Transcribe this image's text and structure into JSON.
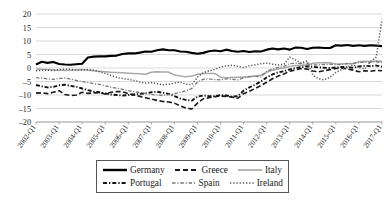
{
  "chart_data": {
    "type": "line",
    "title": "",
    "xlabel": "",
    "ylabel": "",
    "ylim": [
      -20,
      20
    ],
    "ytick_step": 5,
    "yticks": [
      "20",
      "15",
      "10",
      "5",
      "0",
      "-5",
      "-10",
      "-15",
      "-20"
    ],
    "grid": true,
    "legend_position": "bottom",
    "categories": [
      "2002-Q1",
      "2002-Q2",
      "2002-Q3",
      "2002-Q4",
      "2003-Q1",
      "2003-Q2",
      "2003-Q3",
      "2003-Q4",
      "2004-Q1",
      "2004-Q2",
      "2004-Q3",
      "2004-Q4",
      "2005-Q1",
      "2005-Q2",
      "2005-Q3",
      "2005-Q4",
      "2006-Q1",
      "2006-Q2",
      "2006-Q3",
      "2006-Q4",
      "2007-Q1",
      "2007-Q2",
      "2007-Q3",
      "2007-Q4",
      "2008-Q1",
      "2008-Q2",
      "2008-Q3",
      "2008-Q4",
      "2009-Q1",
      "2009-Q2",
      "2009-Q3",
      "2009-Q4",
      "2010-Q1",
      "2010-Q2",
      "2010-Q3",
      "2010-Q4",
      "2011-Q1",
      "2011-Q2",
      "2011-Q3",
      "2011-Q4",
      "2012-Q1",
      "2012-Q2",
      "2012-Q3",
      "2012-Q4",
      "2013-Q1",
      "2013-Q2",
      "2013-Q3",
      "2013-Q4",
      "2014-Q1",
      "2014-Q2",
      "2014-Q3",
      "2014-Q4",
      "2015-Q1",
      "2015-Q2",
      "2015-Q3",
      "2015-Q4",
      "2016-Q1",
      "2016-Q2",
      "2016-Q3",
      "2016-Q4",
      "2017-Q1"
    ],
    "xtick_labels": [
      "2002-Q1",
      "2003-Q1",
      "2004-Q1",
      "2005-Q1",
      "2006-Q1",
      "2007-Q1",
      "2008-Q1",
      "2009-Q1",
      "2010-Q1",
      "2011-Q1",
      "2012-Q1",
      "2013-Q1",
      "2014-Q1",
      "2015-Q1",
      "2016-Q1",
      "2017-Q1"
    ],
    "series": [
      {
        "name": "Germany",
        "style": "solid",
        "color": "#000000",
        "width": 2.1,
        "values": [
          1.3,
          2.3,
          1.9,
          2.2,
          1.5,
          1.3,
          1.2,
          1.4,
          1.6,
          3.9,
          4.2,
          4.3,
          4.3,
          4.5,
          4.6,
          5.2,
          5.4,
          5.4,
          5.7,
          6.1,
          6.0,
          6.6,
          6.9,
          6.6,
          6.6,
          6.1,
          6.0,
          5.6,
          5.3,
          5.6,
          6.2,
          6.5,
          6.2,
          6.8,
          6.3,
          6.0,
          6.3,
          5.9,
          6.2,
          6.1,
          6.8,
          7.2,
          6.9,
          7.2,
          6.8,
          7.6,
          7.5,
          7.0,
          7.5,
          7.6,
          7.4,
          7.4,
          8.4,
          8.3,
          8.5,
          8.2,
          8.4,
          8.2,
          8.4,
          8.3,
          8.1
        ]
      },
      {
        "name": "Greece",
        "style": "dashed",
        "color": "#1a1a1a",
        "width": 1.6,
        "values": [
          -9.3,
          -9.2,
          -9.5,
          -9.0,
          -8.4,
          -9.8,
          -10.2,
          -10.0,
          -9.0,
          -9.4,
          -9.2,
          -9.1,
          -9.6,
          -9.0,
          -8.7,
          -8.8,
          -9.5,
          -10.0,
          -10.5,
          -11.0,
          -11.5,
          -12.0,
          -12.4,
          -12.6,
          -13.0,
          -14.0,
          -14.8,
          -15.2,
          -13.0,
          -11.4,
          -11.0,
          -10.6,
          -10.4,
          -10.5,
          -10.8,
          -11.2,
          -9.5,
          -8.6,
          -7.6,
          -6.5,
          -5.3,
          -4.0,
          -3.0,
          -2.2,
          -1.2,
          -0.7,
          -0.2,
          -0.4,
          -1.1,
          -1.4,
          -1.0,
          -0.6,
          -0.2,
          0.0,
          -0.4,
          -0.8,
          -1.4,
          -1.0,
          -1.2,
          -0.9,
          -1.0
        ]
      },
      {
        "name": "Italy",
        "style": "solid",
        "color": "#a8a8a8",
        "width": 1.5,
        "values": [
          -0.4,
          -0.5,
          -0.6,
          -0.7,
          -0.8,
          -0.9,
          -0.8,
          -0.7,
          -0.6,
          -0.8,
          -1.0,
          -1.2,
          -1.4,
          -1.6,
          -1.7,
          -1.8,
          -1.9,
          -2.0,
          -2.1,
          -2.3,
          -1.6,
          -1.4,
          -1.5,
          -1.5,
          -2.6,
          -3.0,
          -3.2,
          -3.0,
          -2.3,
          -2.0,
          -2.0,
          -2.0,
          -3.4,
          -3.6,
          -3.5,
          -3.4,
          -3.3,
          -3.2,
          -3.0,
          -2.7,
          -1.6,
          -0.8,
          -0.4,
          0.0,
          0.6,
          0.9,
          1.0,
          1.0,
          1.8,
          1.9,
          1.9,
          1.9,
          1.6,
          1.5,
          1.6,
          1.7,
          2.3,
          2.5,
          2.4,
          2.6,
          2.5
        ]
      },
      {
        "name": "Portugal",
        "style": "dash-dot-heavy",
        "color": "#111111",
        "width": 1.9,
        "values": [
          -6.3,
          -6.8,
          -7.2,
          -7.0,
          -6.4,
          -6.2,
          -6.6,
          -7.0,
          -7.6,
          -8.2,
          -8.7,
          -9.0,
          -9.4,
          -9.8,
          -10.0,
          -10.2,
          -10.0,
          -9.8,
          -9.6,
          -9.4,
          -9.0,
          -8.8,
          -9.2,
          -9.6,
          -10.4,
          -11.3,
          -11.8,
          -12.1,
          -10.6,
          -10.2,
          -10.4,
          -10.5,
          -10.0,
          -10.2,
          -10.6,
          -10.4,
          -8.4,
          -7.2,
          -6.2,
          -5.0,
          -3.5,
          -2.4,
          -1.6,
          -1.2,
          -0.5,
          0.0,
          0.3,
          0.6,
          0.4,
          0.2,
          0.1,
          0.0,
          0.2,
          0.4,
          0.3,
          0.1,
          0.6,
          0.8,
          0.7,
          0.9,
          0.5
        ]
      },
      {
        "name": "Spain",
        "style": "dash-dot-thin",
        "color": "#777777",
        "width": 1.3,
        "values": [
          -3.6,
          -3.8,
          -4.0,
          -4.2,
          -3.9,
          -3.7,
          -4.1,
          -4.6,
          -5.0,
          -5.4,
          -5.8,
          -6.1,
          -6.6,
          -7.1,
          -7.5,
          -7.9,
          -8.4,
          -8.8,
          -9.1,
          -9.4,
          -9.8,
          -10.0,
          -10.2,
          -9.9,
          -9.5,
          -9.0,
          -8.4,
          -7.6,
          -5.2,
          -4.2,
          -4.0,
          -4.3,
          -4.4,
          -4.0,
          -4.2,
          -4.4,
          -3.6,
          -3.2,
          -3.0,
          -3.3,
          -1.2,
          -0.4,
          0.2,
          0.6,
          1.6,
          1.8,
          1.6,
          1.5,
          1.1,
          1.2,
          1.3,
          1.4,
          1.2,
          1.4,
          1.6,
          1.7,
          2.0,
          2.2,
          2.1,
          2.3,
          2.0
        ]
      },
      {
        "name": "Ireland",
        "style": "dotted",
        "color": "#555555",
        "width": 1.5,
        "values": [
          -1.0,
          -0.9,
          -0.8,
          -1.0,
          -0.6,
          -0.4,
          -0.5,
          -0.8,
          -0.7,
          -0.6,
          -0.8,
          -1.4,
          -2.0,
          -2.8,
          -3.4,
          -3.9,
          -4.2,
          -4.6,
          -5.2,
          -5.6,
          -5.4,
          -5.8,
          -6.2,
          -6.0,
          -5.6,
          -5.2,
          -6.0,
          -6.2,
          -3.4,
          -1.8,
          -1.0,
          -0.6,
          0.4,
          0.8,
          1.0,
          0.6,
          0.2,
          0.8,
          1.2,
          1.6,
          1.8,
          1.4,
          1.1,
          1.4,
          4.0,
          3.0,
          1.8,
          2.6,
          -2.6,
          -4.0,
          -4.4,
          -3.4,
          -1.6,
          -0.6,
          0.4,
          1.2,
          0.2,
          -0.4,
          2.4,
          4.0,
          18.0
        ]
      }
    ]
  },
  "legend": {
    "rows": [
      [
        {
          "label": "Germany",
          "key": "solid-thick"
        },
        {
          "label": "Greece",
          "key": "dashed"
        },
        {
          "label": "Italy",
          "key": "solid-gray"
        }
      ],
      [
        {
          "label": "Portugal",
          "key": "dash-dot-heavy"
        },
        {
          "label": "Spain",
          "key": "dash-dot-thin"
        },
        {
          "label": "Ireland",
          "key": "dotted"
        }
      ]
    ]
  }
}
